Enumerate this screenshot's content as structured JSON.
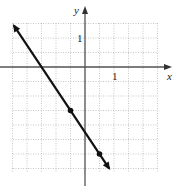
{
  "chart_data": {
    "type": "line",
    "title": "",
    "xlabel": "x",
    "ylabel": "y",
    "x_tick_label": "1",
    "y_tick_label": "1",
    "grid": true,
    "grid_step": 0.5,
    "xlim": [
      -2.5,
      2.5
    ],
    "ylim": [
      -3.6,
      1.5
    ],
    "line": {
      "equation": "y = -1.5x - 2.25",
      "slope": -1.5,
      "intercept": -2.25,
      "arrows": "both",
      "x_range": [
        -2.45,
        0.83
      ]
    },
    "points": [
      {
        "x": -0.5,
        "y": -1.5
      },
      {
        "x": 0.5,
        "y": -3
      }
    ]
  },
  "colors": {
    "grid": "#b8b8b8",
    "axes": "#555555",
    "line": "#111111"
  }
}
